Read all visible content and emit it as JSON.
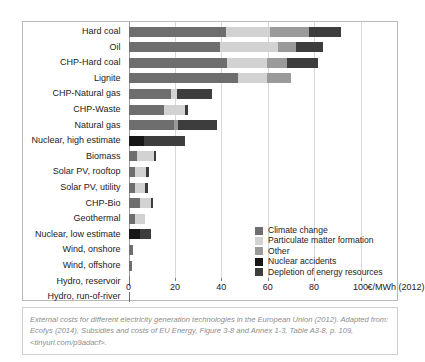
{
  "chart_data": {
    "type": "bar",
    "orientation": "horizontal",
    "stacked": true,
    "title": "",
    "xlabel": "100 €/MWh (2012)",
    "ylabel": "",
    "xlim": [
      0,
      110
    ],
    "xticks": [
      0,
      20,
      40,
      60,
      80,
      100
    ],
    "xticklabels": [
      "0",
      "20",
      "40",
      "60",
      "80",
      "100"
    ],
    "unit_label": "€/MWh (2012)",
    "grid": true,
    "legend_position": "inside-bottom-right",
    "categories": [
      "Hard coal",
      "Oil",
      "CHP-Hard coal",
      "Lignite",
      "CHP-Natural gas",
      "CHP-Waste",
      "Natural gas",
      "Nuclear, high estimate",
      "Biomass",
      "Solar PV, rooftop",
      "Solar PV, utility",
      "CHP-Bio",
      "Geothermal",
      "Nuclear, low estimate",
      "Wind, onshore",
      "Wind, offshore",
      "Hydro, reservoir",
      "Hydro, run-of-river"
    ],
    "series": [
      {
        "name": "Climate change",
        "color": "#6e6e6e",
        "values": [
          42.0,
          39.5,
          42.5,
          47.0,
          18.5,
          15.5,
          19.5,
          0.0,
          3.5,
          3.0,
          3.0,
          5.0,
          3.0,
          0.0,
          2.0,
          1.5,
          0.8,
          0.8
        ]
      },
      {
        "name": "Particulate matter formation",
        "color": "#d2d2d2",
        "values": [
          19.0,
          25.0,
          17.0,
          12.5,
          2.5,
          9.0,
          0.0,
          0.0,
          7.5,
          4.5,
          4.0,
          4.5,
          4.0,
          0.0,
          0.0,
          0.0,
          0.0,
          0.0
        ]
      },
      {
        "name": "Other",
        "color": "#9a9a9a",
        "values": [
          17.0,
          7.5,
          9.0,
          10.5,
          0.0,
          0.0,
          2.0,
          0.0,
          0.0,
          0.0,
          0.0,
          0.0,
          0.0,
          0.0,
          0.0,
          0.0,
          0.0,
          0.0
        ]
      },
      {
        "name": "Nuclear accidents",
        "color": "#171717",
        "values": [
          0.0,
          0.0,
          0.0,
          0.0,
          0.0,
          0.0,
          0.0,
          6.5,
          0.0,
          0.0,
          0.0,
          0.0,
          0.0,
          5.0,
          0.0,
          0.0,
          0.0,
          0.0
        ]
      },
      {
        "name": "Depletion of energy resources",
        "color": "#3d3d3d",
        "values": [
          13.5,
          12.0,
          13.0,
          0.0,
          15.0,
          1.0,
          16.5,
          18.0,
          1.0,
          1.5,
          1.5,
          1.0,
          0.0,
          4.5,
          0.0,
          0.0,
          0.0,
          0.0
        ]
      }
    ],
    "totals": [
      91.5,
      84.0,
      81.5,
      70.0,
      36.0,
      25.5,
      38.0,
      24.5,
      12.0,
      9.0,
      8.5,
      10.5,
      7.0,
      9.5,
      2.0,
      1.5,
      0.8,
      0.8
    ]
  },
  "legend": {
    "items": [
      {
        "label": "Climate change",
        "color": "#6e6e6e"
      },
      {
        "label": "Particulate matter formation",
        "color": "#d2d2d2"
      },
      {
        "label": "Other",
        "color": "#9a9a9a"
      },
      {
        "label": "Nuclear accidents",
        "color": "#171717"
      },
      {
        "label": "Depletion of energy resources",
        "color": "#3d3d3d"
      }
    ]
  },
  "caption": {
    "line1": "External costs for different electricity generation technologies in the European Union (2012).",
    "line2": "Adapted from: Ecofys (2014), Subsidies and costs of EU Energy, Figure 3-8 and Annex 1-3,",
    "line3": "Table A3-8, p. 109, <tinyurl.com/p9adacf>."
  }
}
